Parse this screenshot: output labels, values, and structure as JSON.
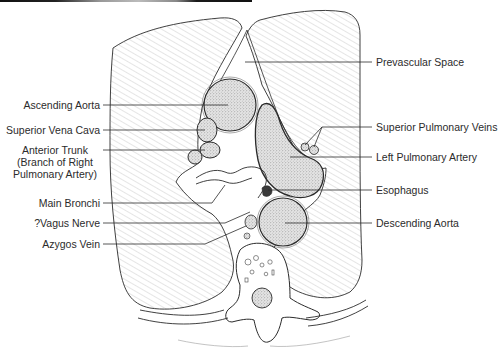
{
  "figure": {
    "type": "axial thoracic cross-section line drawing",
    "colors": {
      "ink": "#2b2b2b",
      "hatch": "#9a9a9a",
      "stipple_fill": "#d6d6d6",
      "background": "#ffffff",
      "top_bar": "#111111"
    }
  },
  "labels": {
    "left": [
      {
        "id": "ascending-aorta",
        "text": "Ascending Aorta"
      },
      {
        "id": "superior-vena-cava",
        "text": "Superior Vena Cava"
      },
      {
        "id": "anterior-trunk",
        "lines": [
          "Anterior Trunk",
          "(Branch of Right",
          "Pulmonary Artery)"
        ]
      },
      {
        "id": "main-bronchi",
        "text": "Main Bronchi"
      },
      {
        "id": "vagus-nerve",
        "text": "?Vagus Nerve"
      },
      {
        "id": "azygos-vein",
        "text": "Azygos Vein"
      }
    ],
    "right": [
      {
        "id": "prevascular-space",
        "text": "Prevascular Space"
      },
      {
        "id": "superior-pulmonary-veins",
        "text": "Superior Pulmonary Veins"
      },
      {
        "id": "left-pulmonary-artery",
        "text": "Left Pulmonary Artery"
      },
      {
        "id": "esophagus",
        "text": "Esophagus"
      },
      {
        "id": "descending-aorta",
        "text": "Descending Aorta"
      }
    ]
  }
}
